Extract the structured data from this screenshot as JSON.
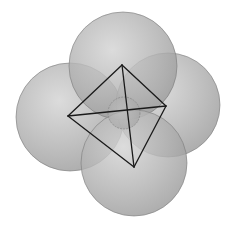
{
  "diagram": {
    "background": "#ffffff",
    "sphere_fill": "#a9a9a9",
    "sphere_highlight": "#d6d6d6",
    "edge_color": "#1a1a1a",
    "spheres": [
      {
        "name": "left-sphere",
        "cx": 70,
        "cy": 117,
        "r": 54
      },
      {
        "name": "right-sphere",
        "cx": 168,
        "cy": 105,
        "r": 52
      },
      {
        "name": "top-sphere",
        "cx": 123,
        "cy": 66,
        "r": 54
      },
      {
        "name": "bottom-sphere",
        "cx": 134,
        "cy": 163,
        "r": 53
      }
    ],
    "central_sphere": {
      "cx": 124,
      "cy": 113,
      "r": 16
    },
    "tetrahedron": {
      "vertices": {
        "top": [
          122,
          65
        ],
        "right": [
          166,
          106
        ],
        "left": [
          68,
          116
        ],
        "bottom": [
          134,
          167
        ]
      },
      "edges": [
        [
          "top",
          "right"
        ],
        [
          "top",
          "left"
        ],
        [
          "top",
          "bottom"
        ],
        [
          "left",
          "right"
        ],
        [
          "left",
          "bottom"
        ],
        [
          "right",
          "bottom"
        ]
      ]
    }
  }
}
